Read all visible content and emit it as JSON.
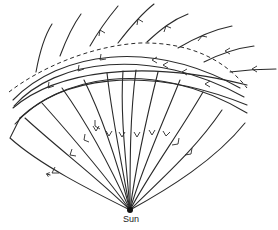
{
  "diagram": {
    "title": "",
    "labels": {
      "sun": "Sun"
    },
    "colors": {
      "line": "#2a2a2a",
      "background": "#ffffff"
    }
  }
}
